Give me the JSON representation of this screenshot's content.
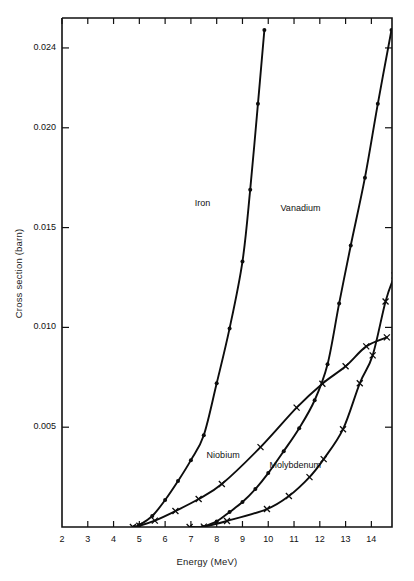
{
  "chart_data": {
    "type": "line",
    "title": "",
    "xlabel": "Energy (MeV)",
    "ylabel": "Cross section (barn)",
    "xlim": [
      2,
      14.8
    ],
    "ylim": [
      0,
      0.0255
    ],
    "grid": false,
    "legend": "inline-labels",
    "xticks": [
      2,
      3,
      4,
      5,
      6,
      7,
      8,
      9,
      10,
      11,
      12,
      13,
      14
    ],
    "xtick_labels": [
      "2",
      "3",
      "4",
      "5",
      "6",
      "7",
      "8",
      "9",
      "10",
      "11",
      "12",
      "13",
      "14"
    ],
    "yticks": [
      0.005,
      0.01,
      0.015,
      0.02,
      0.024
    ],
    "ytick_labels": [
      "0.005",
      "0.010",
      "0.015",
      "0.020",
      "0.024"
    ],
    "series": [
      {
        "name": "Iron",
        "marker": "filled-circle",
        "label_x": 7.45,
        "label_y": 0.0162,
        "points": [
          [
            4.8,
            0.0
          ],
          [
            5.0,
            0.0001
          ],
          [
            5.5,
            0.00055
          ],
          [
            6.0,
            0.00135
          ],
          [
            6.5,
            0.0023
          ],
          [
            7.0,
            0.00335
          ],
          [
            7.5,
            0.0046
          ],
          [
            8.0,
            0.0072
          ],
          [
            8.5,
            0.00995
          ],
          [
            9.0,
            0.0133
          ],
          [
            9.3,
            0.0169
          ],
          [
            9.6,
            0.0212
          ],
          [
            9.85,
            0.0249
          ]
        ]
      },
      {
        "name": "Vanadium",
        "marker": "filled-circle",
        "label_x": 11.25,
        "label_y": 0.01595,
        "points": [
          [
            7.45,
            0.0
          ],
          [
            8.0,
            0.00028
          ],
          [
            8.5,
            0.00075
          ],
          [
            9.0,
            0.00125
          ],
          [
            9.5,
            0.0019
          ],
          [
            10.0,
            0.0027
          ],
          [
            10.6,
            0.0038
          ],
          [
            11.2,
            0.00495
          ],
          [
            11.8,
            0.00635
          ],
          [
            12.3,
            0.00815
          ],
          [
            12.75,
            0.0112
          ],
          [
            13.2,
            0.0141
          ],
          [
            13.75,
            0.0175
          ],
          [
            14.25,
            0.0212
          ],
          [
            14.78,
            0.0249
          ]
        ]
      },
      {
        "name": "Niobium",
        "marker": "cross",
        "label_x": 8.25,
        "label_y": 0.00355,
        "points": [
          [
            4.75,
            0.0
          ],
          [
            5.0,
            6e-05
          ],
          [
            5.6,
            0.00032
          ],
          [
            6.4,
            0.0008
          ],
          [
            7.3,
            0.0014
          ],
          [
            8.2,
            0.00215
          ],
          [
            9.7,
            0.004
          ],
          [
            11.1,
            0.00598
          ],
          [
            12.1,
            0.00718
          ],
          [
            13.0,
            0.00805
          ],
          [
            13.8,
            0.00905
          ],
          [
            14.6,
            0.0095
          ]
        ]
      },
      {
        "name": "Molybdenum",
        "marker": "cross",
        "label_x": 11.05,
        "label_y": 0.00305,
        "points": [
          [
            6.95,
            0.0
          ],
          [
            7.5,
            2e-05
          ],
          [
            8.4,
            0.0003
          ],
          [
            9.95,
            0.0009
          ],
          [
            10.8,
            0.00155
          ],
          [
            11.6,
            0.0025
          ],
          [
            12.15,
            0.0034
          ],
          [
            12.9,
            0.0049
          ],
          [
            13.55,
            0.0072
          ],
          [
            14.05,
            0.0086
          ],
          [
            14.55,
            0.0113
          ],
          [
            14.9,
            0.0126
          ]
        ]
      }
    ]
  }
}
